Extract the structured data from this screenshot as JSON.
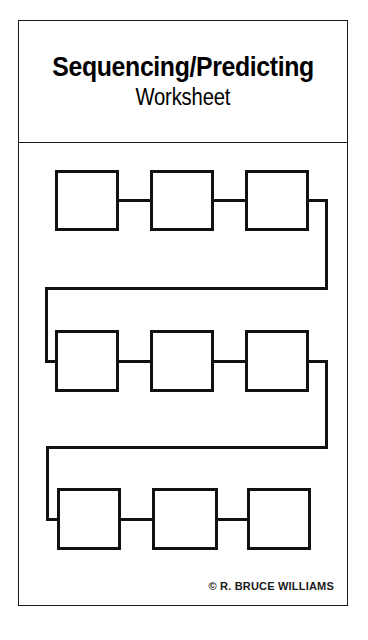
{
  "document": {
    "title_main": "Sequencing/Predicting",
    "title_sub": "Worksheet",
    "credit": "© R. BRUCE WILLIAMS",
    "page_background": "#ffffff",
    "ink_color": "#111111",
    "frame_color": "#1a1a1a"
  },
  "diagram": {
    "type": "serpentine-flowchart",
    "row_count": 3,
    "boxes_per_row": 3,
    "total_boxes": 9,
    "box_fill": "#ffffff",
    "box_stroke": "#111111",
    "box_stroke_width": 3,
    "rows": [
      {
        "row_label": "row-1",
        "boxes": [
          {
            "label": "",
            "slot": "step-1"
          },
          {
            "label": "",
            "slot": "step-2"
          },
          {
            "label": "",
            "slot": "step-3"
          }
        ]
      },
      {
        "row_label": "row-2",
        "boxes": [
          {
            "label": "",
            "slot": "step-4"
          },
          {
            "label": "",
            "slot": "step-5"
          },
          {
            "label": "",
            "slot": "step-6"
          }
        ]
      },
      {
        "row_label": "row-3",
        "boxes": [
          {
            "label": "",
            "slot": "step-7"
          },
          {
            "label": "",
            "slot": "step-8"
          },
          {
            "label": "",
            "slot": "step-9"
          }
        ]
      }
    ],
    "connectors": [
      {
        "name": "connector-step1-step2",
        "kind": "horizontal"
      },
      {
        "name": "connector-step2-step3",
        "kind": "horizontal"
      },
      {
        "name": "connector-row1-row2",
        "kind": "serpentine-right-to-left"
      },
      {
        "name": "connector-step4-step5",
        "kind": "horizontal"
      },
      {
        "name": "connector-step5-step6",
        "kind": "horizontal"
      },
      {
        "name": "connector-row2-row3",
        "kind": "serpentine-right-to-left"
      },
      {
        "name": "connector-step7-step8",
        "kind": "horizontal"
      },
      {
        "name": "connector-step8-step9",
        "kind": "horizontal"
      }
    ]
  }
}
